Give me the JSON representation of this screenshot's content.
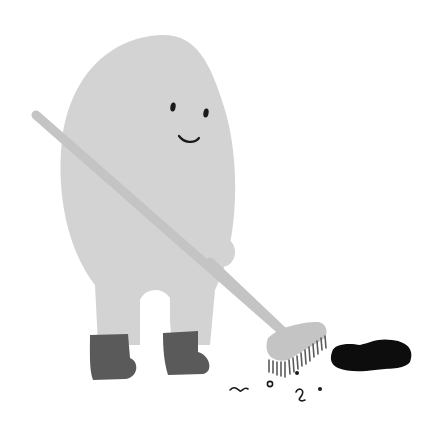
{
  "illustration": {
    "title": "Blob character sweeping with a broom",
    "colors": {
      "background": "#ffffff",
      "body": "#d3d3d3",
      "broom": "#c4c4c4",
      "boots": "#5a5a5a",
      "face": "#1a1a1a",
      "spill": "#0d0d0d",
      "debris": "#1a1a1a"
    },
    "elements": {
      "character": "blob-character",
      "tool": "broom",
      "spill": "black-puddle",
      "debris": "dirt-specks"
    }
  }
}
